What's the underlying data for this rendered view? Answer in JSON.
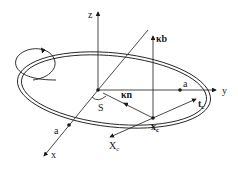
{
  "diagram": {
    "axes": {
      "x": "x",
      "y": "y",
      "z": "z"
    },
    "origin_label": "S",
    "point_a_x": "a",
    "point_a_y": "a",
    "vector_kappa_b": "κb",
    "vector_kappa_n": "κn",
    "point_xc": "x",
    "point_xc_sub": "c",
    "vector_tc": "t",
    "vector_tc_sub": "c",
    "vector_Xc": "X",
    "vector_Xc_sub": "c",
    "colors": {
      "line": "#1a1a1a",
      "background": "#ffffff"
    }
  }
}
